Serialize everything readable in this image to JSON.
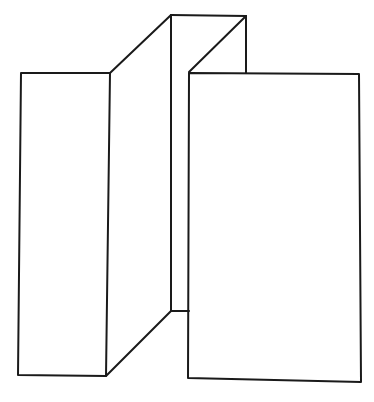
{
  "figure": {
    "stroke_color": "#1a1a1a",
    "background": "#ffffff",
    "segments": [
      {
        "name": "left-panel-front",
        "type": "polygon",
        "points": "21,73 110,73 106,376 18,375"
      },
      {
        "name": "left-panel-side-top",
        "type": "line",
        "x1": 110,
        "y1": 73,
        "x2": 171,
        "y2": 15
      },
      {
        "name": "left-panel-side-bottom",
        "type": "line",
        "x1": 106,
        "y1": 376,
        "x2": 171,
        "y2": 311
      },
      {
        "name": "middle-fold-edge",
        "type": "line",
        "x1": 171,
        "y1": 15,
        "x2": 171,
        "y2": 311
      },
      {
        "name": "middle-top-edge",
        "type": "line",
        "x1": 171,
        "y1": 15,
        "x2": 246,
        "y2": 16
      },
      {
        "name": "middle-diagonal",
        "type": "line",
        "x1": 246,
        "y1": 16,
        "x2": 189,
        "y2": 72
      },
      {
        "name": "middle-right-vertical",
        "type": "line",
        "x1": 246,
        "y1": 16,
        "x2": 246,
        "y2": 73
      },
      {
        "name": "middle-bottom-edge",
        "type": "line",
        "x1": 171,
        "y1": 311,
        "x2": 189,
        "y2": 311
      },
      {
        "name": "right-panel-front",
        "type": "polygon",
        "points": "189,73 359,74 361,382 188,378"
      }
    ]
  }
}
